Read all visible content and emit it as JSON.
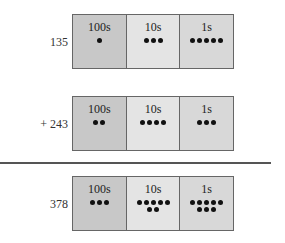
{
  "rows": [
    {
      "label": "135",
      "cells": [
        {
          "heading": "100s",
          "count": 1
        },
        {
          "heading": "10s",
          "count": 3
        },
        {
          "heading": "1s",
          "count": 5
        }
      ]
    },
    {
      "label": "+ 243",
      "cells": [
        {
          "heading": "100s",
          "count": 2
        },
        {
          "heading": "10s",
          "count": 4
        },
        {
          "heading": "1s",
          "count": 3
        }
      ]
    },
    {
      "label": "378",
      "cells": [
        {
          "heading": "100s",
          "count": 3
        },
        {
          "heading": "10s",
          "count": 7
        },
        {
          "heading": "1s",
          "count": 8
        }
      ]
    }
  ],
  "colors": {
    "hundreds_bg": "#c8c8c8",
    "tens_bg": "#e4e4e4",
    "ones_bg": "#d8d8d8",
    "dot": "#111111",
    "rule": "#555555"
  }
}
